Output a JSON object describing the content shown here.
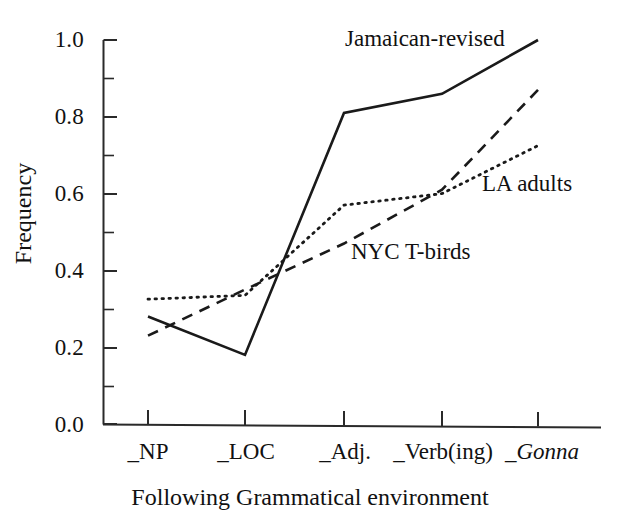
{
  "chart_data": {
    "type": "line",
    "title": "",
    "xlabel": "Following Grammatical environment",
    "ylabel": "Frequency",
    "categories": [
      "_NP",
      "_LOC",
      "_Adj.",
      "_Verb(ing)",
      "_Gonna"
    ],
    "ylim": [
      0.0,
      1.0
    ],
    "xlim": [
      0,
      4
    ],
    "grid": false,
    "legend_position": "inline-annotations",
    "y_ticks_major": [
      "0.0",
      "0.2",
      "0.4",
      "0.6",
      "0.8",
      "1.0"
    ],
    "y_tick_values_major": [
      0.0,
      0.2,
      0.4,
      0.6,
      0.8,
      1.0
    ],
    "y_tick_values_minor": [
      0.1,
      0.3,
      0.5,
      0.7,
      0.9
    ],
    "series": [
      {
        "name": "Jamaican-revised",
        "style": "solid",
        "color": "#1a1a1a",
        "values": [
          0.28,
          0.18,
          0.81,
          0.86,
          1.0
        ]
      },
      {
        "name": "NYC T-birds",
        "style": "dashed",
        "color": "#1a1a1a",
        "values": [
          0.23,
          0.35,
          0.47,
          0.61,
          0.87
        ]
      },
      {
        "name": "LA adults",
        "style": "dotted",
        "color": "#1a1a1a",
        "values": [
          0.325,
          0.335,
          0.57,
          0.6,
          0.725
        ]
      }
    ],
    "annotations": [
      {
        "text": "Jamaican-revised",
        "series": "Jamaican-revised"
      },
      {
        "text": "LA adults",
        "series": "LA adults"
      },
      {
        "text": "NYC T-birds",
        "series": "NYC T-birds"
      }
    ]
  },
  "axis": {
    "y_label": "Frequency",
    "x_label": "Following Grammatical environment",
    "y_ticks": [
      "0.0",
      "0.2",
      "0.4",
      "0.6",
      "0.8",
      "1.0"
    ],
    "x_ticks": [
      "_NP",
      "_LOC",
      "_Adj.",
      "_Verb(ing)",
      "_Gonna"
    ],
    "x_tick_gonna_prefix": "_",
    "x_tick_gonna_italic": "Gonna"
  },
  "annotations": {
    "jamaican": "Jamaican-revised",
    "la_adults": "LA adults",
    "nyc_tbirds": "NYC T-birds"
  }
}
